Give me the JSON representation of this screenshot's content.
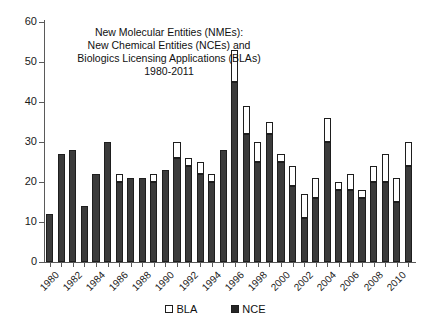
{
  "chart_data": {
    "type": "bar",
    "stacked": true,
    "title_lines": [
      "New Molecular Entities (NMEs):",
      "New Chemical Entities (NCEs) and",
      "Biologics Licensing Applications (BLAs)",
      "1980-2011"
    ],
    "xlabel": "",
    "ylabel": "",
    "ylim": [
      0,
      60
    ],
    "yticks": [
      0,
      10,
      20,
      30,
      40,
      50,
      60
    ],
    "ytick_labels": [
      "0",
      "10",
      "20",
      "30",
      "40",
      "50",
      "60"
    ],
    "grid": false,
    "legend_position": "bottom",
    "legend": [
      {
        "name": "BLA",
        "marker": "open-square",
        "color": "#ffffff"
      },
      {
        "name": "NCE",
        "marker": "filled-square",
        "color": "#262626"
      }
    ],
    "categories": [
      "1980",
      "1981",
      "1982",
      "1983",
      "1984",
      "1985",
      "1986",
      "1987",
      "1988",
      "1989",
      "1990",
      "1991",
      "1992",
      "1993",
      "1994",
      "1995",
      "1996",
      "1997",
      "1998",
      "1999",
      "2000",
      "2001",
      "2002",
      "2003",
      "2004",
      "2005",
      "2006",
      "2007",
      "2008",
      "2009",
      "2010",
      "2011"
    ],
    "xtick_labels_shown": [
      "1980",
      "1982",
      "1984",
      "1986",
      "1988",
      "1990",
      "1992",
      "1994",
      "1996",
      "1998",
      "2000",
      "2002",
      "2004",
      "2006",
      "2008",
      "2010"
    ],
    "series": [
      {
        "name": "NCE",
        "color": "#3b3b3b",
        "values": [
          12,
          27,
          28,
          14,
          22,
          30,
          20,
          21,
          21,
          20,
          23,
          26,
          24,
          22,
          20,
          28,
          45,
          32,
          25,
          32,
          25,
          19,
          11,
          16,
          30,
          18,
          18,
          16,
          20,
          20,
          15,
          24
        ]
      },
      {
        "name": "BLA",
        "color": "#ffffff",
        "values": [
          0,
          0,
          0,
          0,
          0,
          0,
          2,
          0,
          0,
          2,
          0,
          4,
          2,
          3,
          2,
          0,
          8,
          7,
          5,
          3,
          2,
          5,
          6,
          5,
          6,
          2,
          4,
          2,
          4,
          7,
          6,
          6
        ]
      }
    ],
    "totals": [
      12,
      27,
      28,
      14,
      22,
      30,
      22,
      21,
      21,
      22,
      23,
      30,
      26,
      25,
      22,
      28,
      53,
      39,
      30,
      35,
      27,
      24,
      17,
      21,
      36,
      20,
      22,
      18,
      24,
      27,
      21,
      30
    ]
  }
}
